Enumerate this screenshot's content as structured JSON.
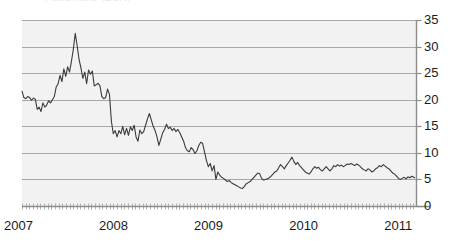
{
  "page": {
    "title_remnant": "Aktienkurs (EUR)",
    "background_color": "#ffffff",
    "plot_background_color": "#f2f2f2",
    "line_color": "#3a3a3a",
    "grid_color": "#a8a8a8",
    "axis_color": "#8c8c8c",
    "label_color": "#1a1a1a"
  },
  "chart_data": {
    "type": "line",
    "title": "",
    "subtitle": "",
    "xlabel": "",
    "ylabel": "",
    "grid": true,
    "legend": false,
    "legend_position": "none",
    "y_axis_side": "right",
    "ylim": [
      0,
      35
    ],
    "yticks": [
      0,
      5,
      10,
      15,
      20,
      25,
      30,
      35
    ],
    "ytick_labels": [
      "0",
      "5",
      "10",
      "15",
      "20",
      "25",
      "30",
      "35"
    ],
    "xlim": [
      2007.0,
      2011.15
    ],
    "xticks": [
      2007,
      2008,
      2009,
      2010,
      2011
    ],
    "xtick_labels": [
      "2007",
      "2008",
      "2009",
      "2010",
      "2011"
    ],
    "minor_xticks": true,
    "series": [
      {
        "name": "price",
        "x": [
          2007.0,
          2007.02,
          2007.04,
          2007.06,
          2007.08,
          2007.1,
          2007.12,
          2007.14,
          2007.16,
          2007.18,
          2007.2,
          2007.22,
          2007.24,
          2007.26,
          2007.28,
          2007.3,
          2007.32,
          2007.34,
          2007.36,
          2007.38,
          2007.4,
          2007.42,
          2007.44,
          2007.46,
          2007.48,
          2007.5,
          2007.52,
          2007.54,
          2007.56,
          2007.58,
          2007.6,
          2007.62,
          2007.64,
          2007.66,
          2007.68,
          2007.7,
          2007.72,
          2007.74,
          2007.76,
          2007.78,
          2007.8,
          2007.82,
          2007.84,
          2007.86,
          2007.88,
          2007.9,
          2007.92,
          2007.94,
          2007.96,
          2007.98,
          2008.0,
          2008.02,
          2008.04,
          2008.06,
          2008.08,
          2008.1,
          2008.12,
          2008.14,
          2008.16,
          2008.18,
          2008.2,
          2008.22,
          2008.24,
          2008.26,
          2008.28,
          2008.3,
          2008.32,
          2008.34,
          2008.36,
          2008.38,
          2008.4,
          2008.42,
          2008.44,
          2008.46,
          2008.48,
          2008.5,
          2008.52,
          2008.54,
          2008.56,
          2008.58,
          2008.6,
          2008.62,
          2008.64,
          2008.66,
          2008.68,
          2008.7,
          2008.72,
          2008.74,
          2008.76,
          2008.78,
          2008.8,
          2008.82,
          2008.84,
          2008.86,
          2008.88,
          2008.9,
          2008.92,
          2008.94,
          2008.96,
          2008.98,
          2009.0,
          2009.02,
          2009.04,
          2009.06,
          2009.08,
          2009.1,
          2009.12,
          2009.14,
          2009.16,
          2009.18,
          2009.2,
          2009.22,
          2009.24,
          2009.26,
          2009.28,
          2009.3,
          2009.32,
          2009.34,
          2009.36,
          2009.38,
          2009.4,
          2009.42,
          2009.44,
          2009.46,
          2009.48,
          2009.5,
          2009.52,
          2009.54,
          2009.56,
          2009.58,
          2009.6,
          2009.62,
          2009.64,
          2009.66,
          2009.68,
          2009.7,
          2009.72,
          2009.74,
          2009.76,
          2009.78,
          2009.8,
          2009.82,
          2009.84,
          2009.86,
          2009.88,
          2009.9,
          2009.92,
          2009.94,
          2009.96,
          2009.98,
          2010.0,
          2010.02,
          2010.04,
          2010.06,
          2010.08,
          2010.1,
          2010.12,
          2010.14,
          2010.16,
          2010.18,
          2010.2,
          2010.22,
          2010.24,
          2010.26,
          2010.28,
          2010.3,
          2010.32,
          2010.34,
          2010.36,
          2010.38,
          2010.4,
          2010.42,
          2010.44,
          2010.46,
          2010.48,
          2010.5,
          2010.52,
          2010.54,
          2010.56,
          2010.58,
          2010.6,
          2010.62,
          2010.64,
          2010.66,
          2010.68,
          2010.7,
          2010.72,
          2010.74,
          2010.76,
          2010.78,
          2010.8,
          2010.82,
          2010.84,
          2010.86,
          2010.88,
          2010.9,
          2010.92,
          2010.94,
          2010.96,
          2010.98,
          2011.0,
          2011.02,
          2011.04,
          2011.06,
          2011.08,
          2011.1,
          2011.13
        ],
        "values": [
          21.6,
          20.4,
          20.2,
          20.6,
          20.4,
          19.9,
          20.3,
          20.1,
          18.2,
          18.6,
          17.8,
          19.4,
          18.6,
          19.0,
          19.8,
          19.4,
          20.0,
          20.6,
          22.4,
          23.0,
          24.6,
          23.4,
          25.8,
          24.4,
          26.2,
          25.2,
          27.2,
          29.5,
          32.5,
          30.2,
          27.6,
          26.0,
          24.0,
          25.2,
          23.0,
          25.6,
          24.8,
          25.4,
          22.6,
          22.8,
          23.1,
          22.6,
          20.6,
          20.2,
          20.4,
          22.0,
          21.0,
          16.0,
          13.6,
          14.2,
          13.0,
          14.2,
          13.6,
          15.0,
          13.4,
          14.6,
          13.3,
          14.9,
          14.2,
          15.2,
          13.0,
          12.2,
          14.3,
          13.6,
          14.0,
          15.2,
          16.4,
          17.4,
          16.2,
          15.0,
          14.2,
          13.0,
          11.4,
          12.6,
          13.8,
          14.4,
          15.4,
          14.6,
          14.8,
          14.2,
          14.6,
          14.0,
          14.4,
          13.8,
          13.0,
          12.2,
          11.0,
          10.4,
          10.2,
          11.0,
          10.6,
          9.9,
          10.4,
          11.4,
          12.0,
          11.8,
          10.2,
          8.6,
          7.4,
          8.0,
          6.6,
          7.6,
          5.0,
          6.4,
          5.8,
          5.4,
          5.2,
          4.9,
          4.6,
          4.8,
          4.4,
          4.2,
          4.0,
          3.8,
          3.6,
          3.4,
          3.3,
          3.7,
          4.2,
          4.4,
          4.6,
          5.0,
          5.4,
          5.8,
          6.2,
          6.1,
          5.2,
          4.9,
          5.0,
          5.1,
          5.3,
          5.6,
          6.0,
          6.4,
          6.6,
          7.2,
          7.8,
          7.4,
          7.0,
          7.6,
          8.1,
          8.6,
          9.2,
          8.4,
          7.8,
          8.2,
          7.6,
          7.2,
          6.8,
          6.4,
          6.2,
          6.0,
          6.4,
          7.0,
          7.4,
          7.1,
          7.3,
          6.8,
          6.6,
          7.0,
          7.4,
          7.0,
          6.6,
          7.0,
          7.6,
          7.4,
          7.8,
          7.5,
          7.7,
          7.4,
          7.6,
          7.9,
          7.8,
          8.0,
          7.8,
          7.6,
          7.9,
          7.7,
          7.4,
          7.0,
          6.8,
          6.6,
          7.0,
          6.8,
          6.4,
          6.6,
          7.0,
          7.2,
          7.6,
          7.4,
          7.8,
          7.5,
          7.2,
          7.0,
          6.6,
          6.2,
          6.0,
          5.6,
          5.2,
          5.0,
          5.2,
          5.4,
          5.1,
          5.5,
          5.3,
          5.6,
          5.3
        ]
      }
    ]
  }
}
